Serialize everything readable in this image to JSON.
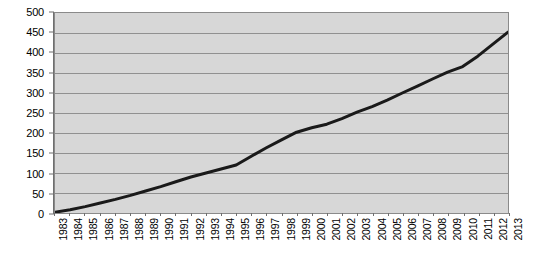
{
  "chart_data": {
    "type": "line",
    "title": "",
    "subtitle": "",
    "xlabel": "",
    "ylabel": "",
    "grid": true,
    "legend": false,
    "legend_position": "none",
    "xlim": [
      1983,
      2013
    ],
    "ylim": [
      0,
      500
    ],
    "y_ticks": [
      0,
      50,
      100,
      150,
      200,
      250,
      300,
      350,
      400,
      450,
      500
    ],
    "x_tick_rotation": -90,
    "categories": [
      "1983",
      "1984",
      "1985",
      "1986",
      "1987",
      "1988",
      "1989",
      "1990",
      "1991",
      "1992",
      "1993",
      "1994",
      "1995",
      "1996",
      "1997",
      "1998",
      "1999",
      "2000",
      "2001",
      "2002",
      "2003",
      "2004",
      "2005",
      "2006",
      "2007",
      "2008",
      "2009",
      "2010",
      "2011",
      "2012",
      "2013"
    ],
    "series": [
      {
        "name": "series-1",
        "color": "#1a1a1a",
        "line_width": 3,
        "values": [
          2,
          8,
          16,
          25,
          34,
          44,
          55,
          66,
          78,
          90,
          100,
          110,
          120,
          142,
          163,
          183,
          202,
          213,
          222,
          236,
          252,
          266,
          282,
          300,
          317,
          335,
          352,
          366,
          392,
          422,
          452
        ]
      }
    ],
    "colors": {
      "plot_background": "#d7d7d7",
      "page_background": "#ffffff",
      "gridline": "#8f8f8f",
      "axis": "#6f6f6f",
      "border": "#8a8a8a",
      "tick_text": "#000000",
      "line": "#1a1a1a"
    }
  }
}
